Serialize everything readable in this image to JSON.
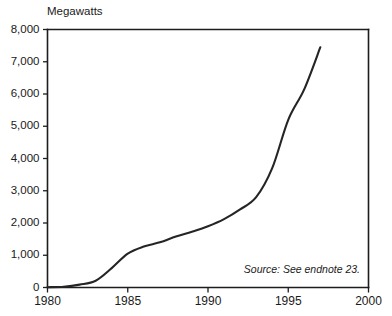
{
  "chart_data": {
    "type": "line",
    "title": "",
    "subtitle": "",
    "xlabel": "",
    "ylabel": "Megawatts",
    "ylabel_position": "top-left-inside",
    "xlim": [
      1980,
      2000
    ],
    "ylim": [
      0,
      8000
    ],
    "grid": false,
    "legend": null,
    "annotations": [
      {
        "name": "source-note",
        "text": "Source: See endnote 23.",
        "style": "italic",
        "position": "bottom-right-inside"
      }
    ],
    "xticks": [
      1980,
      1985,
      1990,
      1995,
      2000
    ],
    "xtick_labels": [
      "1980",
      "1985",
      "1990",
      "1995",
      "2000"
    ],
    "yticks": [
      0,
      1000,
      2000,
      3000,
      4000,
      5000,
      6000,
      7000,
      8000
    ],
    "ytick_labels": [
      "0",
      "1,000",
      "2,000",
      "3,000",
      "4,000",
      "5,000",
      "6,000",
      "7,000",
      "8,000"
    ],
    "series": [
      {
        "name": "Installed capacity",
        "color": "#252525",
        "x": [
          1980,
          1981,
          1982,
          1983,
          1984,
          1985,
          1986,
          1987,
          1988,
          1989,
          1990,
          1991,
          1992,
          1993,
          1994,
          1995,
          1996,
          1997
        ],
        "values": [
          10,
          25,
          90,
          210,
          600,
          1050,
          1270,
          1400,
          1580,
          1730,
          1900,
          2120,
          2420,
          2800,
          3700,
          5200,
          6150,
          7450
        ]
      }
    ]
  },
  "figure": {
    "background_color": "#ffffff",
    "axis_color": "#1d1d1d",
    "line_color": "#252525"
  }
}
